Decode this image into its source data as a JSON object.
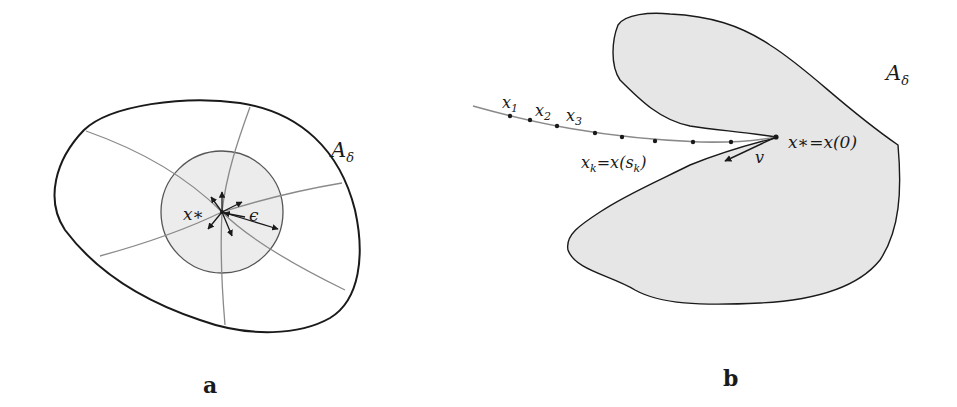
{
  "panel_a": {
    "caption": "a",
    "region_label": "A",
    "region_subscript": "δ",
    "point_label": "x∗",
    "radius_label": "ϵ"
  },
  "panel_b": {
    "caption": "b",
    "region_label": "A",
    "region_subscript": "δ",
    "sequence_labels": [
      {
        "base": "x",
        "sub": "1"
      },
      {
        "base": "x",
        "sub": "2"
      },
      {
        "base": "x",
        "sub": "3"
      }
    ],
    "xk_label": {
      "part1": "x",
      "sub1": "k",
      "part2": "=x(s",
      "sub2": "k",
      "part3": ")"
    },
    "limit_label": "x∗=x(0)",
    "direction_label": "v"
  },
  "colors": {
    "outline": "#1a1a1a",
    "curve_gray": "#8a8a8a",
    "fill_gray": "#e6e6e6",
    "circle_fill": "#ececec"
  }
}
